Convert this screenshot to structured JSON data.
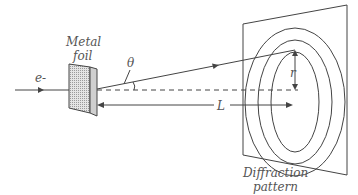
{
  "diagram": {
    "labels": {
      "electron": "e-",
      "foil_line1": "Metal",
      "foil_line2": "foil",
      "theta": "θ",
      "distance": "L",
      "radius": "r",
      "pattern_line1": "Diffraction",
      "pattern_line2": "pattern"
    },
    "colors": {
      "stroke": "#444444",
      "text": "#555555",
      "foil_fill": "#d8d8d8",
      "background": "#ffffff"
    },
    "elements": [
      {
        "id": "incident-beam",
        "type": "arrow",
        "label": "e-"
      },
      {
        "id": "metal-foil",
        "type": "slab",
        "label": "Metal foil"
      },
      {
        "id": "diffracted-ray",
        "type": "arrow",
        "angle_label": "θ"
      },
      {
        "id": "axis",
        "type": "dashed-line"
      },
      {
        "id": "distance-arrow",
        "type": "arrow",
        "label": "L"
      },
      {
        "id": "radius-arrow",
        "type": "double-arrow",
        "label": "r"
      },
      {
        "id": "screen",
        "type": "plane",
        "label": "Diffraction pattern",
        "rings": 3
      }
    ]
  }
}
